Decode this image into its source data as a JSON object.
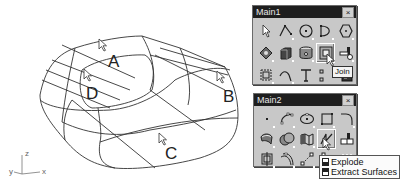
{
  "viewport": {
    "surface_labels": [
      "A",
      "B",
      "C",
      "D"
    ],
    "axis": {
      "z": "z",
      "y": "y",
      "x": "x"
    }
  },
  "main1": {
    "title": "Main1",
    "close_glyph": "×",
    "icons": [
      [
        "select-pointer-icon",
        "polyline-icon",
        "circle-center-icon",
        "arc-icon",
        "polygon-icon"
      ],
      [
        "transform-icon",
        "box-solid-icon",
        "cylinder-icon",
        "join-icon",
        "trim-icon"
      ],
      [
        "group-icon",
        "curve-icon",
        "text-icon",
        "dim-icon",
        "dark-panel-icon"
      ]
    ],
    "active_tool": "join",
    "tooltip": "Join"
  },
  "main2": {
    "title": "Main2",
    "close_glyph": "×",
    "icons": [
      [
        "point-icon",
        "control-point-curve-icon",
        "ellipse-icon",
        "rectangle-icon",
        "fillet-curve-icon"
      ],
      [
        "surface-patch-icon",
        "boolean-union-icon",
        "sweep-icon",
        "explode-icon",
        "split-icon"
      ],
      [
        "group-icon",
        "offset-curve-icon",
        "line-points-icon",
        "extrude-icon",
        "more-icon"
      ]
    ],
    "active_tool": "explode",
    "tooltip_items": [
      {
        "icon": "left-click-icon",
        "label": "Explode"
      },
      {
        "icon": "right-click-icon",
        "label": "Extract Surfaces"
      }
    ]
  }
}
